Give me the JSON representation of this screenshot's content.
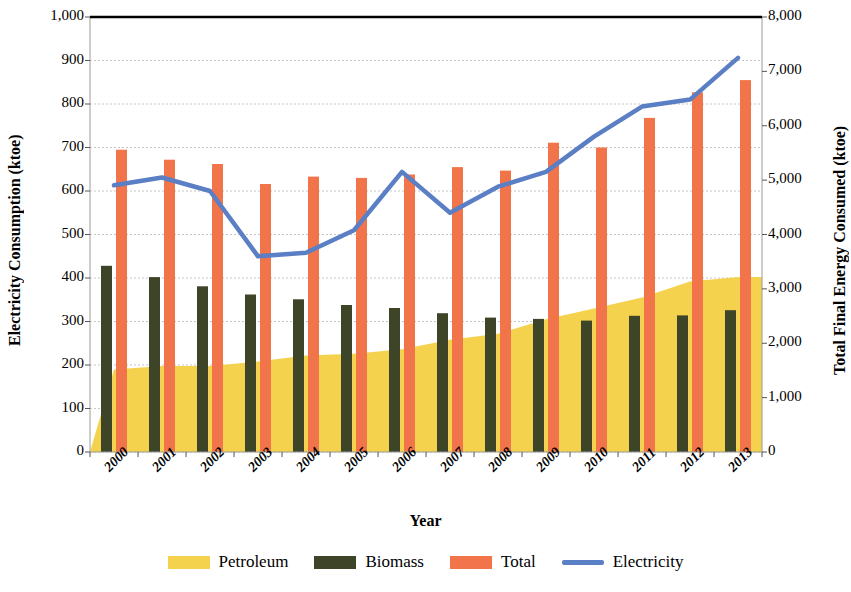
{
  "chart_data": {
    "type": "bar",
    "title": "",
    "xlabel": "Year",
    "ylabel": "Electricity Consumption (ktoe)",
    "y2label": "Total Final Energy Consumed (ktoe)",
    "categories": [
      "2000",
      "2001",
      "2002",
      "2003",
      "2004",
      "2005",
      "2006",
      "2007",
      "2008",
      "2009",
      "2010",
      "2011",
      "2012",
      "2013"
    ],
    "ylim": [
      0,
      1000
    ],
    "y2lim": [
      0,
      8000
    ],
    "yticks": [
      "0",
      "100",
      "200",
      "300",
      "400",
      "500",
      "600",
      "700",
      "800",
      "900",
      "1,000"
    ],
    "ytick_values": [
      0,
      100,
      200,
      300,
      400,
      500,
      600,
      700,
      800,
      900,
      1000
    ],
    "y2ticks": [
      "0",
      "1,000",
      "2,000",
      "3,000",
      "4,000",
      "5,000",
      "6,000",
      "7,000",
      "8,000"
    ],
    "y2tick_values": [
      0,
      1000,
      2000,
      3000,
      4000,
      5000,
      6000,
      7000,
      8000
    ],
    "grid": true,
    "legend_position": "bottom",
    "series": [
      {
        "name": "Petroleum",
        "type": "area",
        "axis": "left",
        "color": "#F5D24E",
        "values": [
          190,
          198,
          198,
          208,
          222,
          226,
          236,
          258,
          272,
          305,
          330,
          355,
          392,
          402
        ]
      },
      {
        "name": "Biomass",
        "type": "bar",
        "axis": "left",
        "color": "#3D4428",
        "values": [
          428,
          402,
          381,
          362,
          351,
          338,
          331,
          319,
          309,
          306,
          302,
          313,
          314,
          326
        ]
      },
      {
        "name": "Total",
        "type": "bar",
        "axis": "right",
        "color": "#F2744A",
        "values": [
          5560,
          5376,
          5296,
          4928,
          5064,
          5040,
          5104,
          5240,
          5176,
          5688,
          5600,
          6144,
          6616,
          6840
        ],
        "values_left_scale": [
          695,
          672,
          662,
          616,
          633,
          630,
          638,
          655,
          647,
          711,
          700,
          768,
          827,
          855
        ]
      },
      {
        "name": "Electricity",
        "type": "line",
        "axis": "right",
        "color": "#5B7FC4",
        "values": [
          4900,
          5050,
          4800,
          3600,
          3660,
          4080,
          5150,
          4400,
          4880,
          5150,
          5800,
          6350,
          6480,
          7250
        ],
        "values_left_scale": [
          613,
          631,
          600,
          450,
          458,
          510,
          644,
          550,
          610,
          644,
          725,
          794,
          810,
          906
        ]
      }
    ]
  },
  "axes": {
    "left_title": "Electricity Consumption (ktoe)",
    "right_title": "Total Final Energy Consumed (ktoe)",
    "x_title": "Year"
  },
  "legend": {
    "items": [
      {
        "label": "Petroleum",
        "color": "#F5D24E",
        "marker": "swatch"
      },
      {
        "label": "Biomass",
        "color": "#3D4428",
        "marker": "swatch"
      },
      {
        "label": "Total",
        "color": "#F2744A",
        "marker": "swatch"
      },
      {
        "label": "Electricity",
        "color": "#5B7FC4",
        "marker": "line"
      }
    ]
  }
}
